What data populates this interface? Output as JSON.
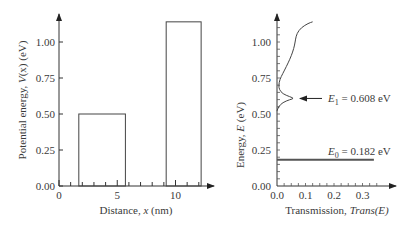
{
  "chart_data": [
    {
      "type": "bar",
      "name": "potential-profile",
      "title": "",
      "xlabel": {
        "prefix": "Distance, ",
        "var": "x",
        "suffix": " (nm)"
      },
      "ylabel": {
        "prefix": "Potential energy, ",
        "var": "V",
        "arg": "(x)",
        "suffix": " (eV)"
      },
      "xlim": [
        0,
        13
      ],
      "ylim": [
        0,
        1.2
      ],
      "xticks": [
        0,
        5,
        10
      ],
      "xtick_labels": [
        "0",
        "5",
        "10"
      ],
      "xminor_ticks": [
        1,
        2,
        3,
        4,
        6,
        7,
        8,
        9,
        11,
        12
      ],
      "yticks": [
        0,
        0.25,
        0.5,
        0.75,
        1.0
      ],
      "ytick_labels": [
        "0.00",
        "0.25",
        "0.50",
        "0.75",
        "1.00"
      ],
      "barriers": [
        {
          "x_start": 1.7,
          "x_end": 5.7,
          "height": 0.5
        },
        {
          "x_start": 9.2,
          "x_end": 12.2,
          "height": 1.14
        }
      ],
      "grid": false
    },
    {
      "type": "line",
      "name": "transmission",
      "title": "",
      "xlabel": {
        "prefix": "Transmission, ",
        "var": "Trans(E)"
      },
      "ylabel": {
        "prefix": "Energy, ",
        "var": "E",
        "suffix": " (eV)"
      },
      "xlim": [
        0,
        0.4
      ],
      "ylim": [
        0,
        1.2
      ],
      "xticks": [
        0,
        0.1,
        0.2,
        0.3
      ],
      "xtick_labels": [
        "0.0",
        "0.1",
        "0.2",
        "0.3"
      ],
      "yticks": [
        0,
        0.25,
        0.5,
        0.75,
        1.0
      ],
      "ytick_labels": [
        "0.00",
        "0.25",
        "0.50",
        "0.75",
        "1.00"
      ],
      "series": [
        {
          "name": "Trans(E) continuum",
          "points": [
            [
              0.0,
              0.52
            ],
            [
              0.005,
              0.55
            ],
            [
              0.02,
              0.58
            ],
            [
              0.045,
              0.6
            ],
            [
              0.06,
              0.608
            ],
            [
              0.045,
              0.62
            ],
            [
              0.02,
              0.64
            ],
            [
              0.008,
              0.67
            ],
            [
              0.006,
              0.7
            ],
            [
              0.01,
              0.74
            ],
            [
              0.02,
              0.78
            ],
            [
              0.033,
              0.83
            ],
            [
              0.045,
              0.88
            ],
            [
              0.055,
              0.93
            ],
            [
              0.062,
              0.98
            ],
            [
              0.065,
              1.02
            ],
            [
              0.07,
              1.06
            ],
            [
              0.085,
              1.1
            ],
            [
              0.11,
              1.13
            ],
            [
              0.125,
              1.14
            ]
          ]
        },
        {
          "name": "E0 resonance",
          "points": [
            [
              0.0,
              0.182
            ],
            [
              0.34,
              0.182
            ]
          ]
        }
      ],
      "annotations": [
        {
          "sym": "E",
          "sub": "1",
          "text": " = 0.608 eV",
          "energy": 0.608,
          "arrow": true
        },
        {
          "sym": "E",
          "sub": "0",
          "text": " = 0.182 eV",
          "energy": 0.182,
          "arrow": false
        }
      ],
      "grid": false
    }
  ]
}
